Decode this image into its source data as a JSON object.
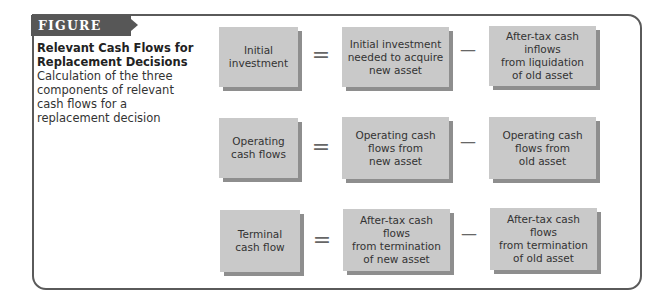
{
  "figure": {
    "label": "FIGURE 11.2",
    "title_line1": "Relevant Cash Flows for",
    "title_line2": "Replacement Decisions",
    "description": "Calculation of the three components of relevant cash flows for a replacement decision"
  },
  "operators": {
    "equals": "=",
    "minus": "—"
  },
  "rows": [
    {
      "result": [
        "Initial",
        "investment"
      ],
      "minuend": [
        "Initial investment",
        "needed to acquire",
        "new asset"
      ],
      "subtrahend": [
        "After-tax cash inflows",
        "from liquidation",
        "of old asset"
      ]
    },
    {
      "result": [
        "Operating",
        "cash flows"
      ],
      "minuend": [
        "Operating cash",
        "flows from",
        "new asset"
      ],
      "subtrahend": [
        "Operating cash",
        "flows from",
        "old asset"
      ]
    },
    {
      "result": [
        "Terminal",
        "cash flow"
      ],
      "minuend": [
        "After-tax cash flows",
        "from termination",
        "of new asset"
      ],
      "subtrahend": [
        "After-tax cash flows",
        "from termination",
        "of old asset"
      ]
    }
  ],
  "colors": {
    "box_fill": "#c9c9c9",
    "box_shadow": "#8e8e8e",
    "label_bg": "#575757",
    "frame": "#5a5a5a"
  }
}
